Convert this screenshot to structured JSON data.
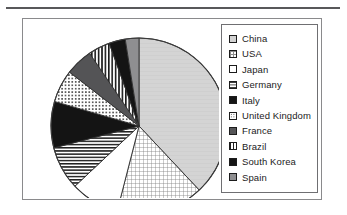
{
  "figure": {
    "background_color": "#ffffff",
    "panel_border_color": "#8a8a8c",
    "rule_color": "#58585a"
  },
  "legend": {
    "position": "right",
    "border_color": "#6f6f72",
    "items": [
      {
        "label": "China",
        "pattern": "light-gray-solid",
        "swatch_class": "sw-lightgray",
        "color": "#d2d2d2"
      },
      {
        "label": "USA",
        "pattern": "fine-grid",
        "swatch_class": "sw-grid",
        "color": "#8d8d8d"
      },
      {
        "label": "Japan",
        "pattern": "white-solid",
        "swatch_class": "sw-white",
        "color": "#ffffff"
      },
      {
        "label": "Germany",
        "pattern": "horizontal-lines",
        "swatch_class": "sw-hlines",
        "color": "#2a2a2a"
      },
      {
        "label": "Italy",
        "pattern": "black-solid",
        "swatch_class": "sw-black",
        "color": "#151515"
      },
      {
        "label": "United Kingdom",
        "pattern": "dotted",
        "swatch_class": "sw-dots",
        "color": "#2a2a2a"
      },
      {
        "label": "France",
        "pattern": "dark-gray-solid",
        "swatch_class": "sw-darkgray",
        "color": "#555557"
      },
      {
        "label": "Brazil",
        "pattern": "vertical-lines",
        "swatch_class": "sw-vlines",
        "color": "#1f1f1f"
      },
      {
        "label": "South Korea",
        "pattern": "black-solid",
        "swatch_class": "sw-black",
        "color": "#151515"
      },
      {
        "label": "Spain",
        "pattern": "medium-gray-solid",
        "swatch_class": "sw-midgray",
        "color": "#8f8f91"
      }
    ]
  },
  "chart_data": {
    "type": "pie",
    "title": "",
    "labels": [
      "China",
      "USA",
      "Japan",
      "Germany",
      "Italy",
      "United Kingdom",
      "France",
      "Brazil",
      "South Korea",
      "Spain"
    ],
    "values": [
      38.0,
      16.0,
      9.0,
      8.0,
      8.5,
      6.0,
      5.0,
      4.0,
      3.0,
      2.5
    ],
    "start_angle_deg": 0,
    "direction": "clockwise",
    "legend_position": "right",
    "grid": false,
    "center_px": [
      116,
      107
    ],
    "radius_px": 88,
    "slice_patterns": [
      "light-gray-solid",
      "fine-grid",
      "white-solid",
      "horizontal-lines",
      "black-solid",
      "dotted",
      "dark-gray-solid",
      "vertical-lines",
      "black-solid",
      "medium-gray-solid"
    ]
  }
}
